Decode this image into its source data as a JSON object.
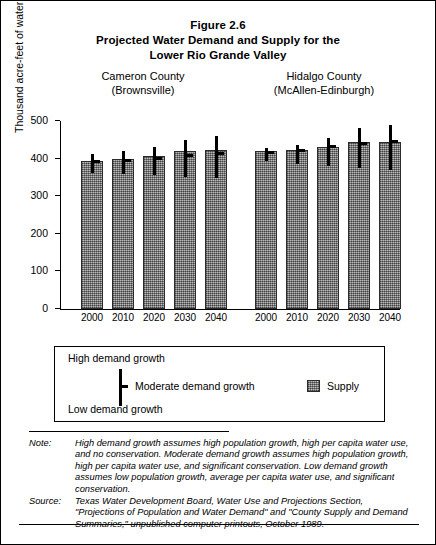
{
  "figure": {
    "title_lines": [
      "Figure 2.6",
      "Projected Water Demand and Supply for the",
      "Lower Rio Grande Valley"
    ]
  },
  "groups": [
    {
      "name": "Cameron County",
      "subtitle": "(Brownsville)"
    },
    {
      "name": "Hidalgo County",
      "subtitle": "(McAllen-Edinburgh)"
    }
  ],
  "axes": {
    "y_title": "Thousand acre-feet of water per year",
    "y_ticks": [
      "0",
      "100",
      "200",
      "300",
      "400",
      "500"
    ],
    "x_ticks_cameron": [
      "2000",
      "2010",
      "2020",
      "2030",
      "2040"
    ],
    "x_ticks_hidalgo": [
      "2000",
      "2010",
      "2020",
      "2030",
      "2040"
    ]
  },
  "legend": {
    "high_label": "High demand growth",
    "moderate_label": "Moderate demand growth",
    "low_label": "Low demand growth",
    "supply_label": "Supply"
  },
  "notes": {
    "note_key": "Note:",
    "note_text": "High demand growth assumes high population growth, high per capita water use, and no conservation. Moderate demand growth assumes high population growth, high per capita water use, and significant conservation. Low demand growth assumes low population growth, average per capita water use, and significant conservation.",
    "source_key": "Source:",
    "source_text": "Texas Water Development Board, Water Use and Projections Section, \"Projections of Population and Water Demand\" and \"County Supply and Demand Summaries,\" unpublished computer printouts, October 1989."
  },
  "chart_data": {
    "type": "bar",
    "title": "Projected Water Demand and Supply for the Lower Rio Grande Valley",
    "xlabel": "",
    "ylabel": "Thousand acre-feet of water per year",
    "ylim": [
      0,
      500
    ],
    "ytick_values": [
      0,
      100,
      200,
      300,
      400,
      500
    ],
    "grid": false,
    "legend_position": "below-plot",
    "categories": [
      "2000",
      "2010",
      "2020",
      "2030",
      "2040"
    ],
    "groups": [
      {
        "group": "Cameron County (Brownsville)",
        "supply": [
          393,
          399,
          406,
          420,
          423
        ],
        "demand_moderate": [
          388,
          392,
          396,
          404,
          410
        ],
        "demand_high": [
          412,
          419,
          430,
          450,
          459
        ],
        "demand_low": [
          363,
          358,
          356,
          352,
          348
        ]
      },
      {
        "group": "Hidalgo County (McAllen-Edinburgh)",
        "supply": [
          421,
          424,
          432,
          443,
          444
        ],
        "demand_moderate": [
          412,
          417,
          427,
          437,
          441
        ],
        "demand_high": [
          428,
          436,
          456,
          481,
          489
        ],
        "demand_low": [
          394,
          386,
          381,
          374,
          369
        ]
      }
    ],
    "series_legend": [
      "High demand growth",
      "Moderate demand growth",
      "Low demand growth",
      "Supply"
    ]
  }
}
